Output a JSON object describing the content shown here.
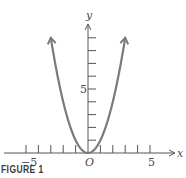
{
  "figure": {
    "caption": "FIGURE 1"
  },
  "chart_data": {
    "type": "line",
    "title": "",
    "function": "y = x^2",
    "series": [
      {
        "name": "y = x^2",
        "x": [
          -3,
          -2.5,
          -2,
          -1.5,
          -1,
          -0.5,
          0,
          0.5,
          1,
          1.5,
          2,
          2.5,
          3
        ],
        "values": [
          9,
          6.25,
          4,
          2.25,
          1,
          0.25,
          0,
          0.25,
          1,
          2.25,
          4,
          6.25,
          9
        ],
        "color": "#7a7a7a",
        "arrows_at_ends": true
      }
    ],
    "xlabel": "x",
    "ylabel": "y",
    "origin_label": "O",
    "x_ticks": [
      -5,
      -4,
      -3,
      -2,
      -1,
      0,
      1,
      2,
      3,
      4,
      5
    ],
    "x_tick_labels": [
      {
        "value": -5,
        "label": "−5"
      },
      {
        "value": 5,
        "label": "5"
      }
    ],
    "y_ticks": [
      1,
      2,
      3,
      4,
      5,
      6,
      7,
      8,
      9
    ],
    "y_tick_labels": [
      {
        "value": 5,
        "label": "5"
      }
    ],
    "xlim": [
      -6.5,
      6.5
    ],
    "ylim": [
      0,
      10
    ],
    "grid": false,
    "legend": "none"
  },
  "labels": {
    "x_axis": "x",
    "y_axis": "y",
    "origin": "O",
    "x_neg5": "−5",
    "x_pos5": "5",
    "y_5": "5"
  },
  "colors": {
    "axis": "#555555",
    "curve": "#7a7a7a",
    "text": "#4a4a4a"
  }
}
